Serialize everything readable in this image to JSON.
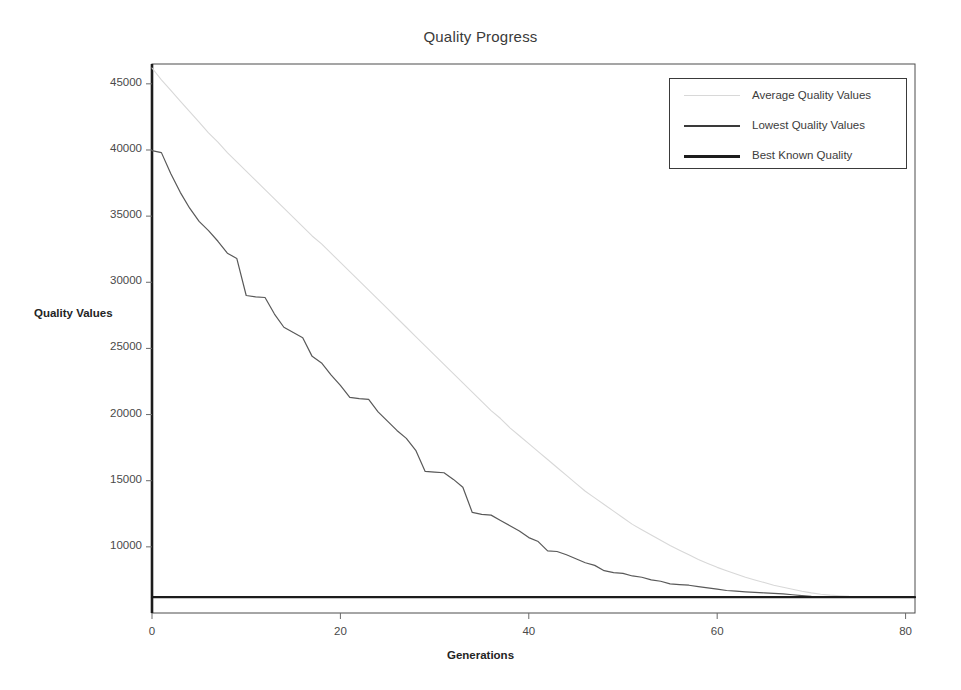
{
  "chart_data": {
    "type": "line",
    "title": "Quality Progress",
    "xlabel": "Generations",
    "ylabel": "Quality Values",
    "xlim": [
      0,
      81
    ],
    "ylim": [
      5000,
      46500
    ],
    "grid": false,
    "legend_position": "top-right",
    "xticks": [
      0,
      20,
      40,
      60,
      80
    ],
    "xtick_labels": [
      "0",
      "20",
      "40",
      "60",
      "80"
    ],
    "yticks": [
      10000,
      15000,
      20000,
      25000,
      30000,
      35000,
      40000,
      45000
    ],
    "ytick_labels": [
      "10000",
      "15000",
      "20000",
      "25000",
      "30000",
      "35000",
      "40000",
      "45000"
    ],
    "series": [
      {
        "name": "Average Quality Values",
        "color": "#d8d8d8",
        "width": 1.1,
        "x": [
          0,
          1,
          2,
          3,
          4,
          5,
          6,
          7,
          8,
          9,
          10,
          11,
          12,
          13,
          14,
          15,
          16,
          17,
          18,
          19,
          20,
          21,
          22,
          23,
          24,
          25,
          26,
          27,
          28,
          29,
          30,
          31,
          32,
          33,
          34,
          35,
          36,
          37,
          38,
          39,
          40,
          41,
          42,
          43,
          44,
          45,
          46,
          47,
          48,
          49,
          50,
          51,
          52,
          53,
          54,
          55,
          56,
          57,
          58,
          59,
          60,
          61,
          62,
          63,
          64,
          65,
          66,
          67,
          68,
          69,
          70,
          71,
          72,
          73,
          74,
          75,
          76,
          77,
          78,
          79,
          80,
          81
        ],
        "y": [
          46200,
          45300,
          44500,
          43700,
          42900,
          42100,
          41300,
          40600,
          39800,
          39100,
          38400,
          37700,
          37000,
          36300,
          35600,
          34900,
          34200,
          33500,
          32900,
          32200,
          31500,
          30800,
          30100,
          29400,
          28700,
          28000,
          27300,
          26600,
          25900,
          25200,
          24500,
          23800,
          23100,
          22400,
          21700,
          21000,
          20300,
          19700,
          19000,
          18400,
          17800,
          17200,
          16600,
          16000,
          15400,
          14800,
          14200,
          13700,
          13200,
          12700,
          12200,
          11700,
          11300,
          10900,
          10500,
          10100,
          9750,
          9400,
          9050,
          8750,
          8450,
          8200,
          7950,
          7700,
          7500,
          7300,
          7100,
          6950,
          6800,
          6650,
          6520,
          6420,
          6350,
          6300,
          6260,
          6240,
          6230,
          6220,
          6210,
          6205,
          6200,
          6200
        ]
      },
      {
        "name": "Lowest Quality Values",
        "color": "#595959",
        "width": 1.2,
        "x": [
          0,
          1,
          2,
          3,
          4,
          5,
          6,
          7,
          8,
          9,
          10,
          11,
          12,
          13,
          14,
          15,
          16,
          17,
          18,
          19,
          20,
          21,
          22,
          23,
          24,
          25,
          26,
          27,
          28,
          29,
          30,
          31,
          32,
          33,
          34,
          35,
          36,
          37,
          38,
          39,
          40,
          41,
          42,
          43,
          44,
          45,
          46,
          47,
          48,
          49,
          50,
          51,
          52,
          53,
          54,
          55,
          56,
          57,
          58,
          59,
          60,
          61,
          62,
          63,
          64,
          65,
          66,
          67,
          68,
          69,
          70,
          71,
          72,
          73,
          74,
          75,
          76,
          77,
          78,
          79,
          80,
          81
        ],
        "y": [
          39950,
          39800,
          38200,
          36800,
          35600,
          34600,
          33900,
          33100,
          32200,
          31800,
          29000,
          28900,
          28850,
          27600,
          26600,
          26200,
          25800,
          24400,
          23900,
          23000,
          22200,
          21300,
          21200,
          21150,
          20200,
          19500,
          18800,
          18200,
          17300,
          15700,
          15650,
          15600,
          15100,
          14500,
          12600,
          12450,
          12400,
          12000,
          11600,
          11200,
          10700,
          10400,
          9700,
          9650,
          9400,
          9100,
          8800,
          8600,
          8200,
          8050,
          8000,
          7800,
          7700,
          7500,
          7400,
          7200,
          7150,
          7100,
          7000,
          6900,
          6800,
          6700,
          6650,
          6600,
          6560,
          6520,
          6480,
          6440,
          6380,
          6320,
          6260,
          6230,
          6210,
          6205,
          6200,
          6200,
          6200,
          6200,
          6200,
          6200,
          6200,
          6200
        ]
      },
      {
        "name": "Best Known Quality",
        "color": "#1c1c1c",
        "width": 2.2,
        "x": [
          0,
          81
        ],
        "y": [
          6200,
          6200
        ]
      }
    ]
  },
  "legend": {
    "entries": [
      {
        "label": "Average Quality Values",
        "color": "#d8d8d8",
        "thickness": "1px"
      },
      {
        "label": "Lowest Quality Values",
        "color": "#3a3a3a",
        "thickness": "2px"
      },
      {
        "label": "Best Known Quality",
        "color": "#1c1c1c",
        "thickness": "3px"
      }
    ]
  }
}
